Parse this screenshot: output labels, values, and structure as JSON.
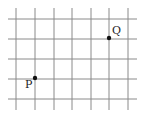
{
  "diagram": {
    "type": "grid-with-points",
    "grid": {
      "columns_x": [
        16,
        35,
        54,
        72,
        91,
        109,
        128
      ],
      "rows_y": [
        19,
        39,
        59,
        79,
        99
      ],
      "x_extent": [
        8,
        137
      ],
      "y_extent": [
        8,
        110
      ],
      "line_color": "#8a8a8a"
    },
    "points": [
      {
        "label": "P",
        "x": 35,
        "y": 78,
        "label_x": 25,
        "label_y": 88
      },
      {
        "label": "Q",
        "x": 109,
        "y": 38,
        "label_x": 112,
        "label_y": 34
      }
    ],
    "point_color": "#111111"
  }
}
